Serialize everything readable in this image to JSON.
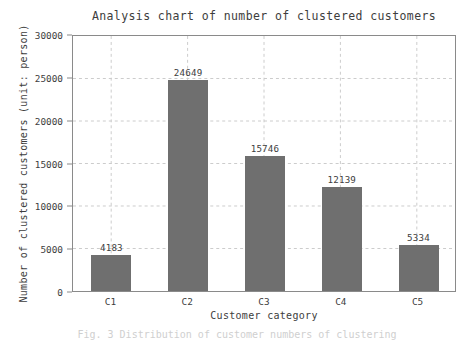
{
  "chart_data": {
    "type": "bar",
    "title": "Analysis chart of number of clustered customers",
    "xlabel": "Customer category",
    "ylabel": "Number of clustered customers (unit: person)",
    "categories": [
      "C1",
      "C2",
      "C3",
      "C4",
      "C5"
    ],
    "values": [
      4183,
      24649,
      15746,
      12139,
      5334
    ],
    "value_labels": [
      "4183",
      "24649",
      "15746",
      "12139",
      "5334"
    ],
    "ylim": [
      0,
      30000
    ],
    "ytick_values": [
      0,
      5000,
      10000,
      15000,
      20000,
      25000,
      30000
    ],
    "ytick_labels": [
      "0",
      "5000",
      "10000",
      "15000",
      "20000",
      "25000",
      "30000"
    ],
    "grid": true,
    "grid_style": "dashed",
    "legend": null,
    "bar_color": "#6f6f6f",
    "axis_color": "#8a8a8a",
    "grid_color": "#cccccc",
    "text_color": "#3d3d3d",
    "background_color": "#ffffff"
  },
  "caption": {
    "text": "Fig. 3  Distribution of customer numbers of clustering"
  }
}
